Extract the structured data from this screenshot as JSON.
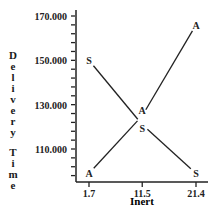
{
  "chart_data": {
    "type": "line",
    "title": "",
    "xlabel": "Inert",
    "ylabel": "Delivery Time",
    "x": [
      1.7,
      11.5,
      21.4
    ],
    "x_tick_labels": [
      "1.7",
      "11.5",
      "21.4"
    ],
    "y_tick_labels": [
      "170.000",
      "150.000",
      "130.000",
      "110.000"
    ],
    "y_ticks": [
      170,
      150,
      130,
      110
    ],
    "ylim": [
      95,
      170
    ],
    "grid": false,
    "legend": "none (series marked by letter symbols)",
    "series": [
      {
        "name": "A",
        "marker": "A",
        "values": [
          99,
          125,
          166
        ]
      },
      {
        "name": "S",
        "marker": "S",
        "values": [
          150,
          121,
          99
        ]
      }
    ]
  },
  "axes": {
    "xlabel": "Inert",
    "ylabel_letters": [
      "D",
      "e",
      "l",
      "i",
      "v",
      "e",
      "r",
      "y",
      " ",
      "T",
      "i",
      "m",
      "e"
    ]
  }
}
